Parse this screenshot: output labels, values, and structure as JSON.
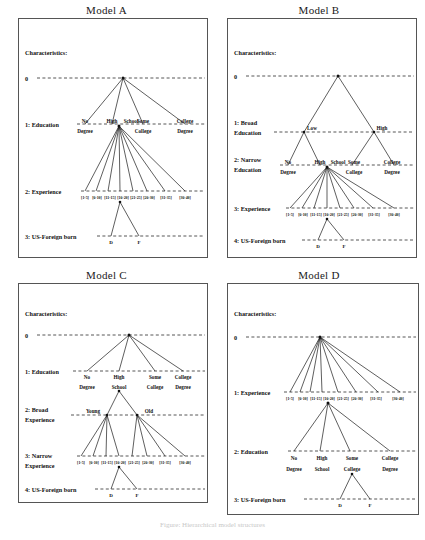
{
  "figure": {
    "caption": "Figure: Hierarchical model structures"
  },
  "common": {
    "characteristics_label": "Characteristics:",
    "zero_label": "0",
    "education_nodes": [
      {
        "line1": "No",
        "line2": "Degree"
      },
      {
        "line1": "High",
        "line2": "School"
      },
      {
        "line1": "Some",
        "line2": "College"
      },
      {
        "line1": "College",
        "line2": "Degree"
      }
    ],
    "experience_brackets": [
      "[1-5]",
      "[6-10]",
      "[11-15]",
      "[16-20]",
      "[21-25]",
      "[26-30]",
      "[31-35]",
      "[36-40]"
    ],
    "nativity_leaves": [
      "D",
      "F"
    ],
    "broad_education_nodes": [
      "Low",
      "High"
    ],
    "broad_experience_nodes": [
      "Young",
      "Old"
    ]
  },
  "panels": [
    {
      "id": "model-a",
      "title": "Model A",
      "levels": [
        {
          "index": "1",
          "name": "Education",
          "label": "1: Education"
        },
        {
          "index": "2",
          "name": "Experience",
          "label": "2: Experience"
        },
        {
          "index": "3",
          "name": "US-Foreign born",
          "label": "3: US-Foreign born"
        }
      ]
    },
    {
      "id": "model-b",
      "title": "Model B",
      "levels": [
        {
          "index": "1",
          "name": "Broad Education",
          "label_line1": "1:  Broad",
          "label_line2": "Education"
        },
        {
          "index": "2",
          "name": "Narrow Education",
          "label_line1": "2:  Narrow",
          "label_line2": "Education"
        },
        {
          "index": "3",
          "name": "Experience",
          "label": "3: Experience"
        },
        {
          "index": "4",
          "name": "US-Foreign born",
          "label": "4: US-Foreign born"
        }
      ]
    },
    {
      "id": "model-c",
      "title": "Model C",
      "levels": [
        {
          "index": "1",
          "name": "Education",
          "label": "1: Education"
        },
        {
          "index": "2",
          "name": "Broad Experience",
          "label_line1": "2: Broad",
          "label_line2": "Experience"
        },
        {
          "index": "3",
          "name": "Narrow Experience",
          "label_line1": "3: Narrow",
          "label_line2": "Experience"
        },
        {
          "index": "4",
          "name": "US-Foreign born",
          "label": "4: US-Foreign born"
        }
      ]
    },
    {
      "id": "model-d",
      "title": "Model D",
      "levels": [
        {
          "index": "1",
          "name": "Experience",
          "label": "1: Experience"
        },
        {
          "index": "2",
          "name": "Education",
          "label": "2: Education"
        },
        {
          "index": "3",
          "name": "US-Foreign born",
          "label": "3: US-Foreign born"
        }
      ]
    }
  ]
}
